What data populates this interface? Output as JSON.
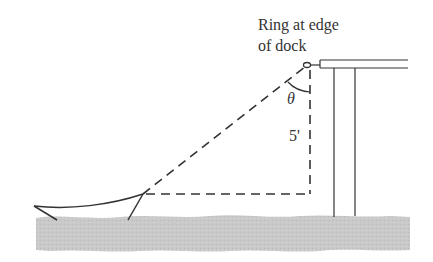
{
  "diagram": {
    "labels": {
      "ring_line1": "Ring at edge",
      "ring_line2": "of dock",
      "angle": "θ",
      "height": "5'"
    },
    "colors": {
      "line": "#333333",
      "water": "#c8c8c8",
      "background": "#ffffff"
    }
  }
}
